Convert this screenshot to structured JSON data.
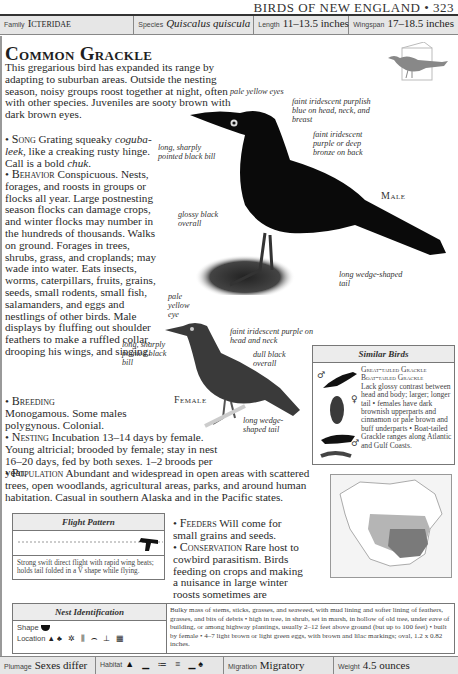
{
  "running_head": "BIRDS OF NEW ENGLAND • 323",
  "header": {
    "family": {
      "label": "Family",
      "value": "Icteridae"
    },
    "species": {
      "label": "Species",
      "value": "Quiscalus quiscula"
    },
    "length": {
      "label": "Length",
      "value": "11–13.5 inches"
    },
    "wingspan": {
      "label": "Wingspan",
      "value": "17–18.5 inches"
    }
  },
  "title": "Common Grackle",
  "intro": "This gregarious bird has expanded its range by adapting to suburban areas. Outside the nesting season, noisy groups roost together at night, often with other species. Juveniles are sooty brown with dark brown eyes.",
  "sections": {
    "song": {
      "heading": "Song",
      "text_a": "Grating squeaky",
      "call_word": "coguba-leek",
      "text_b": ", like a creaking rusty hinge. Call is a bold",
      "call2": "chuk",
      "text_c": "."
    },
    "behavior": {
      "heading": "Behavior",
      "text": "Conspicuous. Nests, forages, and roosts in groups or flocks all year. Large postnesting season flocks can damage crops, and winter flocks may number in the hundreds of thousands. Walks on ground. Forages in trees, shrubs, grass, and croplands; may wade into water. Eats insects, worms, caterpillars, fruits, grains, seeds, small rodents, small fish, salamanders, and eggs and nestlings of other birds. Male displays by fluffing out shoulder feathers to make a ruffled collar, drooping his wings, and singing."
    },
    "breeding": {
      "heading": "Breeding",
      "text": "Monogamous. Some males polygynous. Colonial."
    },
    "nesting": {
      "heading": "Nesting",
      "text": "Incubation 13–14 days by female. Young altricial; brooded by female; stay in nest 16–20 days, fed by both sexes. 1–2 broods per year."
    },
    "population": {
      "heading": "Population",
      "text": "Abundant and widespread in open areas with scattered trees, open woodlands, agricultural areas, parks, and around human habitation. Casual in southern Alaska and in the Pacific states."
    },
    "feeders": {
      "heading": "Feeders",
      "text": "Will come for small grains and seeds."
    },
    "conservation": {
      "heading": "Conservation",
      "text": "Rare host to cowbird parasitism. Birds feeding on crops and making a nuisance in large winter roosts sometimes are destroyed."
    }
  },
  "male_annotations": {
    "eyes": "pale yellow eyes",
    "head": "faint iridescent purplish blue on head, neck, and breast",
    "back": "faint iridescent purple or deep bronze on back",
    "bill": "long, sharply pointed black bill",
    "overall": "glossy black overall",
    "tail": "long wedge-shaped tail",
    "label": "Male"
  },
  "female_annotations": {
    "eye": "pale yellow eye",
    "head": "faint iridescent purple on head and neck",
    "bill": "long, sharply pointed black bill",
    "overall": "dull black overall",
    "tail": "long wedge-shaped tail",
    "label": "Female"
  },
  "similar_birds": {
    "title": "Similar Birds",
    "names": [
      "Great-tailed Grackle",
      "Boat-tailed Grackle"
    ],
    "text": "Lack glossy contrast between head and body; larger; longer tail • females have dark brownish upperparts and cinnamon or pale brown and buff underparts • Boat-tailed Grackle ranges along Atlantic and Gulf Coasts.",
    "symbols": [
      "♂",
      "♀",
      "♂",
      "♀"
    ]
  },
  "flight_pattern": {
    "title": "Flight Pattern",
    "text": "Strong swift direct flight with rapid wing beats; holds tail folded in a V shape while flying."
  },
  "nest_identification": {
    "title": "Nest Identification",
    "shape_label": "Shape",
    "location_label": "Location",
    "text": "Bulky mass of stems, sticks, grasses, and seaweed, with mud lining and softer lining of feathers, grasses, and bits of debris • high in tree, in shrub, set in marsh, in hollow of old tree, under eave of building, or among highway plantings, usually 2–12 feet above ground (but up to 100 feet) • built by female • 4–7 light brown or light green eggs, with brown and lilac markings; oval, 1.2 x 0.82 inches."
  },
  "footer": {
    "plumage": {
      "label": "Plumage",
      "value": "Sexes differ"
    },
    "habitat": {
      "label": "Habitat"
    },
    "migration": {
      "label": "Migration",
      "value": "Migratory"
    },
    "weight": {
      "label": "Weight",
      "value": "4.5 ounces"
    }
  },
  "colors": {
    "header_bg": "#e6e6e6",
    "map_light": "#b5b5b5",
    "map_dark": "#7a7a7a"
  }
}
